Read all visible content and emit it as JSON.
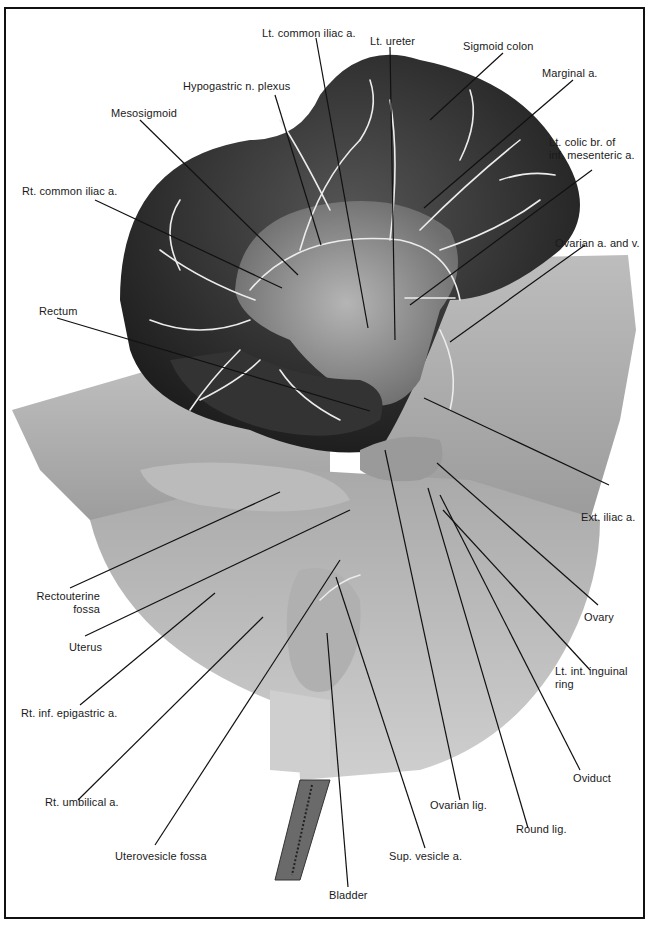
{
  "figure": {
    "colors": {
      "frame": "#111111",
      "specimen_dark": "#2a2a2a",
      "specimen_mid": "#7a7a7a",
      "specimen_light": "#c9c9c9",
      "vessels": "#e8e8e8",
      "leader_lines": "#111111"
    }
  },
  "labels": {
    "lt_common_iliac": "Lt. common iliac a.",
    "lt_ureter": "Lt. ureter",
    "sigmoid_colon": "Sigmoid colon",
    "hypogastric_plexus": "Hypogastric n. plexus",
    "marginal_a": "Marginal a.",
    "mesosigmoid": "Mesosigmoid",
    "lt_colic_br": "Lt. colic br. of\ninf. mesenteric a.",
    "rt_common_iliac": "Rt. common iliac a.",
    "ovarian_a_v": "Ovarian a. and v.",
    "rectum": "Rectum",
    "ext_iliac": "Ext. iliac a.",
    "rectouterine_fossa": "Rectouterine\nfossa",
    "ovary": "Ovary",
    "uterus": "Uterus",
    "lt_int_inguinal_ring": "Lt. int. inguinal\nring",
    "rt_inf_epigastric": "Rt. inf. epigastric a.",
    "oviduct": "Oviduct",
    "rt_umbilical": "Rt. umbilical a.",
    "ovarian_lig": "Ovarian lig.",
    "round_lig": "Round lig.",
    "uterovesicle_fossa": "Uterovesicle fossa",
    "sup_vesicle": "Sup. vesicle a.",
    "bladder": "Bladder"
  }
}
